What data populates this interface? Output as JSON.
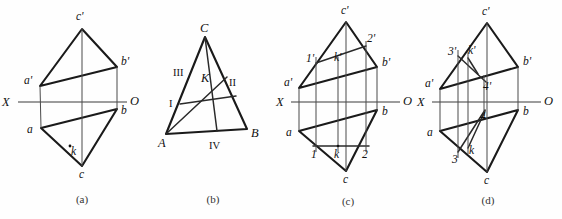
{
  "figure": {
    "background_color": "#fefefe",
    "line_color": "#1a1a1a",
    "axis_color": "#3a3a3a"
  },
  "captions": [
    {
      "text": "(a)",
      "x": 82,
      "y": 202
    },
    {
      "text": "(b)",
      "x": 213,
      "y": 202
    },
    {
      "text": "(c)",
      "x": 348,
      "y": 204
    },
    {
      "text": "(d)",
      "x": 488,
      "y": 203
    }
  ],
  "panels": {
    "a": {
      "id": "panel-a",
      "axis": {
        "x1": 18,
        "y1": 102,
        "x2": 127,
        "y2": 102
      },
      "axis_labels": [
        {
          "text": "X",
          "x": 5,
          "y": 106
        },
        {
          "text": "O",
          "x": 131,
          "y": 105
        }
      ],
      "vertices": {
        "c_prime": {
          "x": 82,
          "y": 29,
          "label": "c'",
          "lx": 78,
          "ly": 19
        },
        "a_prime": {
          "x": 40,
          "y": 86,
          "label": "a'",
          "lx": 25,
          "ly": 83
        },
        "b_prime": {
          "x": 117,
          "y": 67,
          "label": "b'",
          "lx": 122,
          "ly": 64
        },
        "a": {
          "x": 41,
          "y": 128,
          "label": "a",
          "lx": 27,
          "ly": 132
        },
        "b": {
          "x": 117,
          "y": 109,
          "label": "b",
          "lx": 122,
          "ly": 113
        },
        "c": {
          "x": 82,
          "y": 166,
          "label": "c",
          "lx": 80,
          "ly": 178
        }
      },
      "point_k": {
        "x": 70,
        "y": 148,
        "label": "k",
        "lx": 72,
        "ly": 155,
        "marker": "small-circle"
      }
    },
    "b": {
      "id": "panel-b",
      "vertices": {
        "A": {
          "x": 166,
          "y": 134,
          "label": "A",
          "lx": 159,
          "ly": 146
        },
        "B": {
          "x": 247,
          "y": 129,
          "label": "B",
          "lx": 252,
          "ly": 137
        },
        "C": {
          "x": 205,
          "y": 37,
          "label": "C",
          "lx": 202,
          "ly": 31
        }
      },
      "point_k": {
        "x": 205,
        "y": 85,
        "label": "K",
        "lx": 203,
        "ly": 82
      },
      "region_labels": [
        {
          "text": "III",
          "x": 176,
          "y": 74
        },
        {
          "text": "II",
          "x": 231,
          "y": 84
        },
        {
          "text": "I",
          "x": 171,
          "y": 105
        },
        {
          "text": "IV",
          "x": 212,
          "y": 147
        }
      ],
      "cevian_1": {
        "x1": 166,
        "y1": 134,
        "x2": 226,
        "y2": 78,
        "name": "line-A-to-II"
      },
      "cevian_2": {
        "x1": 205,
        "y1": 37,
        "x2": 216,
        "y2": 131,
        "name": "line-C-to-IV"
      },
      "cevian_3": {
        "x1": 180,
        "y1": 104,
        "x2": 236,
        "y2": 96,
        "name": "line-I-to-B-side"
      }
    },
    "c": {
      "id": "panel-c",
      "axis": {
        "x1": 291,
        "y1": 102,
        "x2": 400,
        "y2": 102
      },
      "axis_labels": [
        {
          "text": "X",
          "x": 279,
          "y": 106
        },
        {
          "text": "O",
          "x": 404,
          "y": 105
        }
      ],
      "vertices": {
        "c_prime": {
          "x": 346,
          "y": 22,
          "label": "c'",
          "lx": 342,
          "ly": 14
        },
        "a_prime": {
          "x": 299,
          "y": 88,
          "label": "a'",
          "lx": 285,
          "ly": 85
        },
        "b_prime": {
          "x": 377,
          "y": 67,
          "label": "b'",
          "lx": 383,
          "ly": 66
        },
        "a": {
          "x": 299,
          "y": 131,
          "label": "a",
          "lx": 286,
          "ly": 134
        },
        "b": {
          "x": 377,
          "y": 110,
          "label": "b",
          "lx": 383,
          "ly": 114
        },
        "c": {
          "x": 346,
          "y": 171,
          "label": "c",
          "lx": 344,
          "ly": 182
        }
      },
      "aux_points_v": [
        {
          "name": "one-prime",
          "x": 316,
          "y": 63,
          "label": "1'",
          "lx": 308,
          "ly": 61
        },
        {
          "name": "two-prime",
          "x": 366,
          "y": 46,
          "label": "2'",
          "lx": 368,
          "ly": 42
        },
        {
          "name": "k-prime",
          "x": 338,
          "y": 63,
          "label": "k'",
          "lx": 336,
          "ly": 60
        }
      ],
      "aux_points_h": [
        {
          "name": "one",
          "x": 316,
          "y": 146,
          "label": "1",
          "lx": 312,
          "ly": 157
        },
        {
          "name": "two",
          "x": 366,
          "y": 146,
          "label": "2",
          "lx": 363,
          "ly": 157
        },
        {
          "name": "k",
          "x": 338,
          "y": 146,
          "label": "k",
          "lx": 335,
          "ly": 157
        }
      ],
      "chord_upper": {
        "x1": 316,
        "y1": 63,
        "x2": 366,
        "y2": 46
      },
      "chord_lower": {
        "x1": 316,
        "y1": 146,
        "x2": 366,
        "y2": 146
      },
      "projectors": [
        {
          "name": "projector-1",
          "x": 316,
          "y1": 57,
          "y2": 152
        },
        {
          "name": "projector-k",
          "x": 338,
          "y1": 57,
          "y2": 152
        },
        {
          "name": "projector-2",
          "x": 366,
          "y1": 41,
          "y2": 152
        }
      ]
    },
    "d": {
      "id": "panel-d",
      "axis": {
        "x1": 432,
        "y1": 102,
        "x2": 541,
        "y2": 102
      },
      "axis_labels": [
        {
          "text": "X",
          "x": 420,
          "y": 106
        },
        {
          "text": "O",
          "x": 545,
          "y": 105
        }
      ],
      "vertices": {
        "c_prime": {
          "x": 487,
          "y": 23,
          "label": "c'",
          "lx": 483,
          "ly": 14
        },
        "a_prime": {
          "x": 440,
          "y": 89,
          "label": "a'",
          "lx": 426,
          "ly": 86
        },
        "b_prime": {
          "x": 518,
          "y": 67,
          "label": "b'",
          "lx": 524,
          "ly": 65
        },
        "a": {
          "x": 440,
          "y": 131,
          "label": "a",
          "lx": 427,
          "ly": 135
        },
        "b": {
          "x": 518,
          "y": 110,
          "label": "b",
          "lx": 524,
          "ly": 114
        },
        "c": {
          "x": 487,
          "y": 172,
          "label": "c",
          "lx": 485,
          "ly": 183
        }
      },
      "aux_points_v": [
        {
          "name": "three-prime",
          "x": 458,
          "y": 56,
          "label": "3'",
          "lx": 450,
          "ly": 54
        },
        {
          "name": "four-prime",
          "x": 484,
          "y": 81,
          "label": "4'",
          "lx": 484,
          "ly": 88
        },
        {
          "name": "k-prime",
          "x": 468,
          "y": 58,
          "label": "k'",
          "lx": 469,
          "ly": 55
        }
      ],
      "aux_points_h": [
        {
          "name": "three",
          "x": 458,
          "y": 152,
          "label": "3",
          "lx": 452,
          "ly": 161
        },
        {
          "name": "four",
          "x": 484,
          "y": 110,
          "label": "4",
          "lx": 481,
          "ly": 118
        },
        {
          "name": "k",
          "x": 468,
          "y": 148,
          "label": "k",
          "lx": 470,
          "ly": 153
        }
      ],
      "chord_upper": {
        "x1": 458,
        "y1": 56,
        "x2": 484,
        "y2": 81
      },
      "chord_lower": {
        "x1": 458,
        "y1": 152,
        "x2": 484,
        "y2": 110
      },
      "k_connector_upper": {
        "x1": 468,
        "y1": 58,
        "x2": 477,
        "y2": 73
      },
      "projectors": [
        {
          "name": "projector-3",
          "x": 458,
          "y1": 50,
          "y2": 158
        },
        {
          "name": "projector-k",
          "x": 468,
          "y1": 52,
          "y2": 154
        },
        {
          "name": "projector-4",
          "x": 484,
          "y1": 75,
          "y2": 116
        }
      ]
    }
  }
}
